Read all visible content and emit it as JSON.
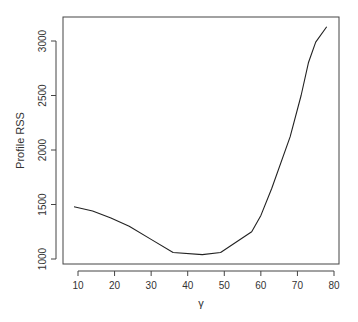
{
  "chart_data": {
    "type": "line",
    "title": "",
    "xlabel": "γ",
    "ylabel": "Profile RSS",
    "xlim": [
      7,
      81.5
    ],
    "ylim": [
      960,
      3225
    ],
    "grid": false,
    "legend": null,
    "x_ticks": [
      10,
      20,
      30,
      40,
      50,
      60,
      70,
      80
    ],
    "y_ticks": [
      1000,
      1500,
      2000,
      2500,
      3000
    ],
    "series": [
      {
        "name": "Profile RSS",
        "color": "#222222",
        "x": [
          8.9,
          14,
          19,
          24,
          30,
          36,
          44,
          49,
          57.5,
          60,
          63,
          68,
          71,
          73,
          75,
          78
        ],
        "y": [
          1480,
          1440,
          1375,
          1300,
          1180,
          1060,
          1040,
          1060,
          1250,
          1400,
          1650,
          2120,
          2500,
          2800,
          2990,
          3130
        ]
      }
    ]
  },
  "layout": {
    "plot_left": 63,
    "plot_top": 17,
    "plot_right": 339,
    "plot_bottom": 264,
    "axis_x_px": [
      78,
      334
    ],
    "axis_y_px": [
      259,
      41
    ]
  }
}
